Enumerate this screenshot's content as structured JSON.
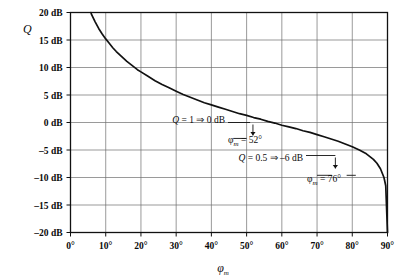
{
  "chart_data": {
    "type": "line",
    "title": "",
    "xlabel": "φm",
    "ylabel": "Q",
    "xlabel_base": "φ",
    "xlabel_sub": "m",
    "ylim": [
      -20,
      20
    ],
    "xlim": [
      0,
      90
    ],
    "grid": true,
    "legend": "none",
    "x_unit": "degrees",
    "y_unit": "dB",
    "x_ticks": [
      "0°",
      "10°",
      "20°",
      "30°",
      "40°",
      "50°",
      "60°",
      "70°",
      "80°",
      "90°"
    ],
    "x_tick_values": [
      0,
      10,
      20,
      30,
      40,
      50,
      60,
      70,
      80,
      90
    ],
    "y_ticks": [
      "20 dB",
      "15 dB",
      "10 dB",
      "5 dB",
      "0 dB",
      "–5 dB",
      "–10 dB",
      "–15 dB",
      "–20 dB"
    ],
    "y_tick_values": [
      20,
      15,
      10,
      5,
      0,
      -5,
      -10,
      -15,
      -20
    ],
    "series": [
      {
        "name": "Q vs phase margin",
        "relation": "Q = 1 / (2 sin(φm/2))",
        "x": [
          5.8,
          6,
          7,
          8,
          9,
          10,
          11,
          12,
          13,
          14,
          15,
          16,
          17,
          18,
          19,
          20,
          22,
          24,
          26,
          28,
          30,
          32,
          34,
          36,
          38,
          40,
          42,
          44,
          46,
          48,
          50,
          52,
          54,
          56,
          58,
          60,
          62,
          64,
          66,
          68,
          70,
          72,
          74,
          76,
          78,
          80,
          82,
          84,
          85,
          86,
          87,
          88,
          89,
          89.5,
          90
        ],
        "y": [
          20.0,
          19.6,
          18.3,
          17.1,
          16.1,
          15.2,
          14.4,
          13.6,
          12.9,
          12.3,
          11.7,
          11.1,
          10.6,
          10.1,
          9.6,
          9.2,
          8.4,
          7.6,
          6.9,
          6.3,
          5.7,
          5.1,
          4.6,
          4.1,
          3.6,
          3.2,
          2.8,
          2.4,
          2.0,
          1.6,
          1.3,
          0.9,
          0.6,
          0.2,
          -0.1,
          -0.5,
          -0.8,
          -1.1,
          -1.5,
          -1.8,
          -2.2,
          -2.6,
          -3.0,
          -3.4,
          -3.9,
          -4.4,
          -5.0,
          -5.7,
          -6.2,
          -6.7,
          -7.4,
          -8.4,
          -10.0,
          -11.5,
          -20.0
        ]
      }
    ],
    "annotations": [
      {
        "id": "q1",
        "text": "Q = 1 ⇒ 0 dB",
        "text_italic_part": "Q",
        "text_rest": " = 1 ⇒ 0 dB",
        "at_x": 52,
        "at_y": 0,
        "value_q": 1,
        "value_db": 0
      },
      {
        "id": "phim52",
        "text": "φm = 52°",
        "base": "φ",
        "sub": "m",
        "rest": " = 52°",
        "at_x": 52,
        "value": 52
      },
      {
        "id": "q05",
        "text": "Q = 0.5 ⇒ –6 dB",
        "text_italic_part": "Q",
        "text_rest": " = 0.5 ⇒ –6 dB",
        "at_x": 76,
        "at_y": -6,
        "value_q": 0.5,
        "value_db": -6
      },
      {
        "id": "phim76",
        "text": "φm = 76°",
        "base": "φ",
        "sub": "m",
        "rest": " = 76°",
        "at_x": 76,
        "value": 76
      }
    ],
    "colors": {
      "curve": "#111111",
      "grid": "#6f6f6f",
      "axis": "#111111",
      "background": "#ffffff",
      "text": "#0a0a0a"
    }
  }
}
